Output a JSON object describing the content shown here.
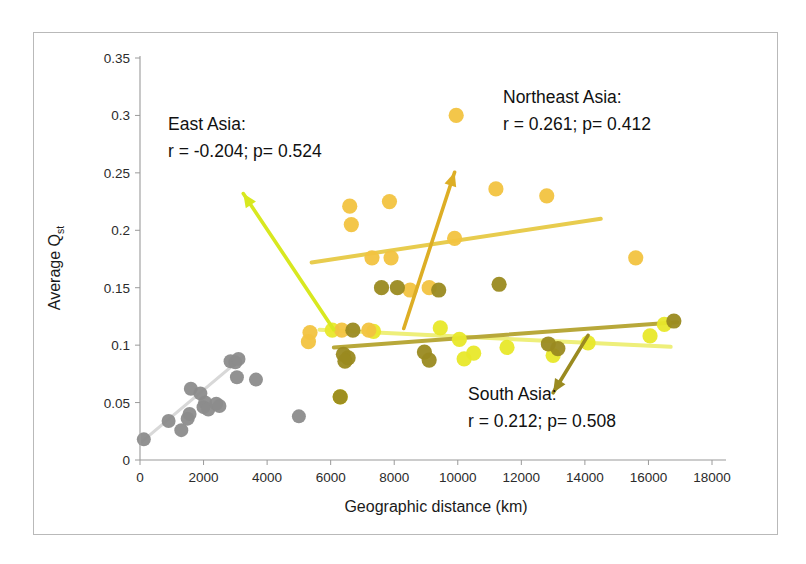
{
  "chart_data": {
    "type": "scatter",
    "title": "",
    "xlabel": "Geographic distance (km)",
    "ylabel": "Average Qst",
    "ylabel_main": "Average Q",
    "ylabel_sub": "st",
    "xlim": [
      0,
      18000
    ],
    "ylim": [
      0,
      0.35
    ],
    "xticks": [
      0,
      2000,
      4000,
      6000,
      8000,
      10000,
      12000,
      14000,
      16000,
      18000
    ],
    "xtick_labels": [
      "0",
      "2000",
      "4000",
      "6000",
      "8000",
      "10000",
      "12000",
      "14000",
      "16000",
      "18000"
    ],
    "yticks": [
      0,
      0.05,
      0.1,
      0.15,
      0.2,
      0.25,
      0.3,
      0.35
    ],
    "ytick_labels": [
      "0",
      "0.05",
      "0.1",
      "0.15",
      "0.2",
      "0.25",
      "0.3",
      "0.35"
    ],
    "grid": false,
    "legend": "none",
    "colors": {
      "grey": "#8c8c8c",
      "grey_trend": "#d8d8d8",
      "bright_yellow": "#e8e82a",
      "pale_yellow_trend": "#eeef7a",
      "amber": "#f2c340",
      "amber_trend": "#e8cc4e",
      "olive": "#9a8a20",
      "olive_trend": "#b8a83a",
      "east_asia_arrow": "#d8e820",
      "northeast_asia_arrow": "#ddae25",
      "south_asia_arrow": "#9a8a20"
    },
    "series": [
      {
        "name": "Reference (grey)",
        "color": "#8c8c8c",
        "points": [
          [
            120,
            0.018
          ],
          [
            900,
            0.034
          ],
          [
            1300,
            0.026
          ],
          [
            1500,
            0.036
          ],
          [
            1560,
            0.04
          ],
          [
            1600,
            0.062
          ],
          [
            1900,
            0.058
          ],
          [
            2000,
            0.046
          ],
          [
            2050,
            0.05
          ],
          [
            2150,
            0.044
          ],
          [
            2400,
            0.049
          ],
          [
            2500,
            0.047
          ],
          [
            2850,
            0.086
          ],
          [
            3000,
            0.085
          ],
          [
            3050,
            0.072
          ],
          [
            3100,
            0.088
          ],
          [
            3650,
            0.07
          ],
          [
            5000,
            0.038
          ]
        ],
        "trend": {
          "x": [
            60,
            3250
          ],
          "y": [
            0.016,
            0.09
          ],
          "color": "#d8d8d8"
        }
      },
      {
        "name": "East Asia",
        "color": "#e8e82a",
        "r": -0.204,
        "p": 0.524,
        "label": "East Asia:",
        "stats": "r = -0.204; p= 0.524",
        "points": [
          [
            6050,
            0.113
          ],
          [
            6300,
            0.055
          ],
          [
            7350,
            0.112
          ],
          [
            9450,
            0.115
          ],
          [
            10050,
            0.105
          ],
          [
            10200,
            0.088
          ],
          [
            10500,
            0.093
          ],
          [
            11550,
            0.098
          ],
          [
            13000,
            0.091
          ],
          [
            14100,
            0.102
          ],
          [
            16500,
            0.118
          ],
          [
            16050,
            0.108
          ]
        ],
        "trend": {
          "x": [
            5650,
            16700
          ],
          "y": [
            0.1135,
            0.0985
          ],
          "color": "#eeef7a"
        }
      },
      {
        "name": "Northeast Asia",
        "color": "#f2c340",
        "r": 0.261,
        "p": 0.412,
        "label": "Northeast Asia:",
        "stats": "r = 0.261; p= 0.412",
        "points": [
          [
            5350,
            0.111
          ],
          [
            5300,
            0.103
          ],
          [
            6600,
            0.221
          ],
          [
            6650,
            0.205
          ],
          [
            7300,
            0.176
          ],
          [
            7900,
            0.176
          ],
          [
            7850,
            0.225
          ],
          [
            9950,
            0.3
          ],
          [
            9900,
            0.193
          ],
          [
            11200,
            0.236
          ],
          [
            12800,
            0.23
          ],
          [
            15600,
            0.176
          ],
          [
            8500,
            0.148
          ],
          [
            9100,
            0.15
          ],
          [
            6350,
            0.113
          ],
          [
            7200,
            0.113
          ]
        ],
        "trend": {
          "x": [
            5400,
            14500
          ],
          "y": [
            0.172,
            0.21
          ],
          "color": "#e8cc4e"
        }
      },
      {
        "name": "South Asia",
        "color": "#9a8a20",
        "r": 0.212,
        "p": 0.508,
        "label": "South Asia:",
        "stats": "r = 0.212; p= 0.508",
        "points": [
          [
            6400,
            0.092
          ],
          [
            6550,
            0.089
          ],
          [
            6450,
            0.086
          ],
          [
            7600,
            0.15
          ],
          [
            8100,
            0.15
          ],
          [
            9400,
            0.148
          ],
          [
            8950,
            0.094
          ],
          [
            9100,
            0.087
          ],
          [
            11300,
            0.153
          ],
          [
            12850,
            0.101
          ],
          [
            13150,
            0.097
          ],
          [
            16800,
            0.121
          ],
          [
            6300,
            0.055
          ],
          [
            6700,
            0.113
          ]
        ],
        "trend": {
          "x": [
            6100,
            16900
          ],
          "y": [
            0.098,
            0.12
          ],
          "color": "#b8a83a"
        }
      }
    ],
    "annotations": [
      {
        "id": "east-asia",
        "label": "East Asia:",
        "stats": "r = -0.204; p= 0.524",
        "arrow_color": "#d8e820",
        "arrow_from": [
          6100,
          0.1135
        ],
        "arrow_to": [
          3250,
          0.232
        ]
      },
      {
        "id": "northeast-asia",
        "label": "Northeast Asia:",
        "stats": "r = 0.261; p= 0.412",
        "arrow_color": "#ddae25",
        "arrow_from": [
          8300,
          0.1145
        ],
        "arrow_to": [
          9900,
          0.2505
        ]
      },
      {
        "id": "south-asia",
        "label": "South Asia:",
        "stats": "r = 0.212; p= 0.508",
        "arrow_color": "#9a8a20",
        "arrow_from": [
          14100,
          0.1085
        ],
        "arrow_to": [
          13000,
          0.0585
        ]
      }
    ]
  },
  "axes": {
    "x_title": "Geographic distance (km)",
    "y_title_main": "Average Q",
    "y_title_sub": "st"
  }
}
